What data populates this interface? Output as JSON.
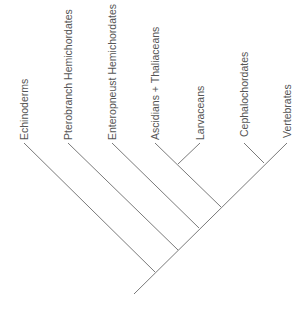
{
  "diagram": {
    "type": "cladogram",
    "line_color": "#7a7a7a",
    "text_color": "#555555",
    "root": {
      "x": 134,
      "y": 294
    },
    "trunk_end": {
      "x": 287,
      "y": 143
    },
    "taxa": [
      {
        "name": "Echinoderms",
        "tip": {
          "x": 24,
          "y": 143
        },
        "node": {
          "x": 155,
          "y": 272
        }
      },
      {
        "name": "Pterobranch Hemichordates",
        "tip": {
          "x": 68,
          "y": 143
        },
        "node": {
          "x": 178,
          "y": 250
        }
      },
      {
        "name": "Enteropneust Hemichordates",
        "tip": {
          "x": 112,
          "y": 143
        },
        "node": {
          "x": 199,
          "y": 228
        }
      },
      {
        "name": "Ascidians + Thaliaceans",
        "tip": {
          "x": 155,
          "y": 143
        },
        "node": {
          "x": 221,
          "y": 207
        }
      },
      {
        "name": "Larvaceans",
        "tip": {
          "x": 200,
          "y": 143
        },
        "node": {
          "x": 178,
          "y": 164
        }
      },
      {
        "name": "Cephalochordates",
        "tip": {
          "x": 244,
          "y": 143
        },
        "node": {
          "x": 264,
          "y": 163
        }
      },
      {
        "name": "Vertebrates",
        "tip": {
          "x": 287,
          "y": 143
        },
        "node": {
          "x": 287,
          "y": 143
        }
      }
    ]
  }
}
